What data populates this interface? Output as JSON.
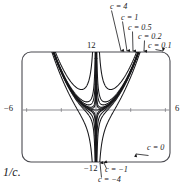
{
  "figure": {
    "caption": "1/c.",
    "frame": {
      "x": 22,
      "y": 52,
      "width": 148,
      "height": 110,
      "radius": 9
    },
    "axes": {
      "origin": {
        "x": 96,
        "y": 110
      },
      "x_left_label": "−6",
      "x_right_label": "6",
      "y_top_label": "12",
      "y_bottom_label": "−12",
      "axis_color": "#8d8d92",
      "curve_color": "#17171a",
      "frame_color": "#4a4a50",
      "x_ticks": [
        -6,
        -3,
        3,
        6
      ],
      "y_ticks": [
        -12,
        -6,
        6,
        12
      ]
    },
    "labels": [
      {
        "name": "c-4",
        "text": "c = 4",
        "x": 110,
        "y": 3,
        "leader_to_x": 121,
        "leader_to_y": 51
      },
      {
        "name": "c-1",
        "text": "c = 1",
        "x": 121,
        "y": 14,
        "leader_to_x": 127,
        "leader_to_y": 51
      },
      {
        "name": "c-05",
        "text": "c = 0.5",
        "x": 131,
        "y": 24,
        "leader_to_x": 133,
        "leader_to_y": 51
      },
      {
        "name": "c-02",
        "text": "c = 0.2",
        "x": 143,
        "y": 33,
        "leader_to_x": 144,
        "leader_to_y": 51
      },
      {
        "name": "c-01",
        "text": "c = 0.1",
        "x": 154,
        "y": 42,
        "leader_to_x": 163,
        "leader_to_y": 51
      },
      {
        "name": "c-0",
        "text": "c = 0",
        "x": 147,
        "y": 148,
        "leader_to_x": 136,
        "leader_to_y": 154
      },
      {
        "name": "c-neg1",
        "text": "c = −1",
        "x": 105,
        "y": 170,
        "leader_to_x": 104,
        "leader_to_y": 163
      },
      {
        "name": "c-neg4",
        "text": "c = −4",
        "x": 100,
        "y": 179,
        "leader_to_x": 100,
        "leader_to_y": 163
      }
    ],
    "curves": [
      {
        "c": 4,
        "name": "curve-c-4"
      },
      {
        "c": 1,
        "name": "curve-c-1"
      },
      {
        "c": 0.5,
        "name": "curve-c-0.5"
      },
      {
        "c": 0.2,
        "name": "curve-c-0.2"
      },
      {
        "c": 0.1,
        "name": "curve-c-0.1"
      },
      {
        "c": 0,
        "name": "curve-c-0"
      },
      {
        "c": -0.1,
        "name": "curve-c-neg-0.1"
      },
      {
        "c": -0.2,
        "name": "curve-c-neg-0.2"
      },
      {
        "c": -0.5,
        "name": "curve-c-neg-0.5"
      },
      {
        "c": -1,
        "name": "curve-c-neg-1"
      },
      {
        "c": -4,
        "name": "curve-c-neg-4"
      }
    ]
  }
}
